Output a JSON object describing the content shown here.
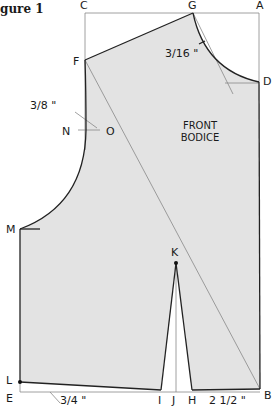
{
  "figure": {
    "title": "gure 1"
  },
  "pattern": {
    "name_line1": "FRONT",
    "name_line2": "BODICE",
    "fill_color": "#e3e3e3",
    "line_color": "#222222",
    "guide_color": "#777777"
  },
  "points": {
    "A": "A",
    "B": "B",
    "C": "C",
    "D": "D",
    "E": "E",
    "F": "F",
    "G": "G",
    "H": "H",
    "I": "I",
    "J": "J",
    "K": "K",
    "L": "L",
    "M": "M",
    "N": "N",
    "O": "O"
  },
  "measurements": {
    "neck": "3/16 \"",
    "armhole": "3/8 \"",
    "waist_drop": "3/4 \"",
    "dart_offset": "2 1/2 \""
  }
}
